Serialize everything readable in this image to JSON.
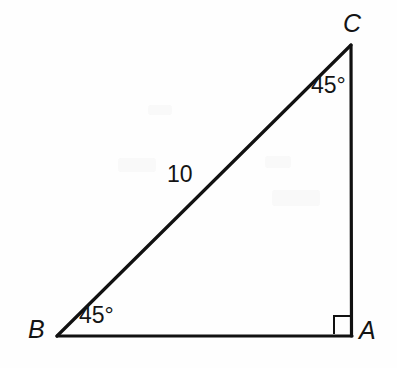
{
  "figure": {
    "width": 397,
    "height": 368,
    "background_color": "#fefefe",
    "stroke_color": "#111111",
    "text_color": "#141414"
  },
  "diagram": {
    "type": "right-triangle",
    "vertices": [
      {
        "name": "A",
        "label": "A",
        "x": 352,
        "y": 336,
        "label_x": 359,
        "label_y": 318
      },
      {
        "name": "B",
        "label": "B",
        "x": 57,
        "y": 336,
        "label_x": 28,
        "label_y": 317
      },
      {
        "name": "C",
        "label": "C",
        "x": 351,
        "y": 45,
        "label_x": 343,
        "label_y": 11
      }
    ],
    "edges": [
      {
        "name": "BA",
        "from": "B",
        "to": "A",
        "label": "",
        "stroke_width": 3.2
      },
      {
        "name": "AC",
        "from": "A",
        "to": "C",
        "label": "",
        "stroke_width": 3.2
      },
      {
        "name": "BC",
        "from": "B",
        "to": "C",
        "label": "10",
        "stroke_width": 3.2
      }
    ],
    "angle_labels": [
      {
        "name": "angle-at-C",
        "at_vertex": "C",
        "label": "45°",
        "x": 311,
        "y": 74
      },
      {
        "name": "angle-at-B",
        "at_vertex": "B",
        "label": "45°",
        "x": 79,
        "y": 304
      }
    ],
    "side_labels": [
      {
        "name": "length-BC",
        "on_edge": "BC",
        "label": "10",
        "x": 167,
        "y": 163
      }
    ],
    "right_angle_marker": {
      "name": "right-angle-marker",
      "at_vertex": "A",
      "x": 334,
      "y": 314,
      "size": 17,
      "stroke_width": 2
    }
  }
}
